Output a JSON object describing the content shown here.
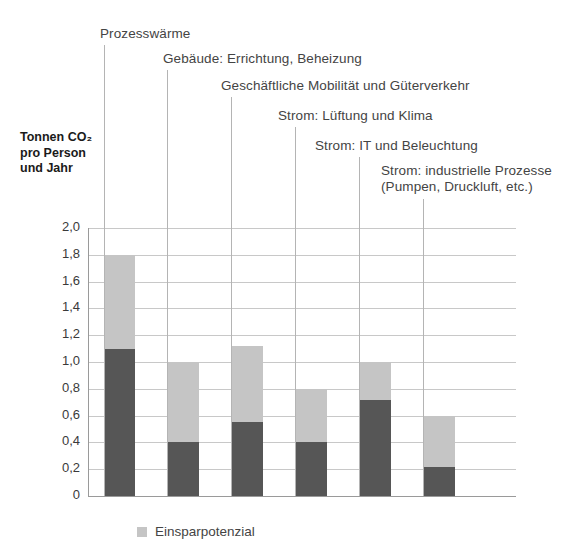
{
  "axis_title": "Tonnen CO₂\npro Person\nund Jahr",
  "legend": {
    "swatch_name": "einsparpotenzial-swatch",
    "label": "Einsparpotenzial"
  },
  "callouts": [
    {
      "text": "Prozesswärme"
    },
    {
      "text": "Gebäude: Errichtung, Beheizung"
    },
    {
      "text": "Geschäftliche Mobilität und Güterverkehr"
    },
    {
      "text": "Strom: Lüftung und Klima"
    },
    {
      "text": "Strom: IT und Beleuchtung"
    },
    {
      "text": "Strom: industrielle Prozesse\n(Pumpen, Druckluft, etc.)"
    }
  ],
  "chart_data": {
    "type": "bar",
    "title": "",
    "subtitle": "",
    "xlabel": "",
    "ylabel": "Tonnen CO₂ pro Person und Jahr",
    "ylim": [
      0,
      2.0
    ],
    "ytick_step": 0.2,
    "ytick_labels": [
      "0",
      "0,2",
      "0,4",
      "0,6",
      "0,8",
      "1,0",
      "1,2",
      "1,4",
      "1,6",
      "1,8",
      "2,0"
    ],
    "ytick_values": [
      0,
      0.2,
      0.4,
      0.6,
      0.8,
      1.0,
      1.2,
      1.4,
      1.6,
      1.8,
      2.0
    ],
    "grid": true,
    "stacked": true,
    "legend_position": "bottom",
    "categories": [
      "Prozesswärme",
      "Gebäude: Errichtung, Beheizung",
      "Geschäftliche Mobilität und Güterverkehr",
      "Strom: Lüftung und Klima",
      "Strom: IT und Beleuchtung",
      "Strom: industrielle Prozesse (Pumpen, Druckluft, etc.)"
    ],
    "series": [
      {
        "name": "Verbleibende Emissionen",
        "color": "#565656",
        "values": [
          1.1,
          0.4,
          0.55,
          0.4,
          0.72,
          0.22
        ]
      },
      {
        "name": "Einsparpotenzial",
        "color": "#c5c5c5",
        "values": [
          0.7,
          0.6,
          0.57,
          0.4,
          0.28,
          0.38
        ]
      }
    ],
    "totals": [
      1.8,
      1.0,
      1.12,
      0.8,
      1.0,
      0.6
    ]
  },
  "colors": {
    "dark": "#565656",
    "light": "#c5c5c5",
    "grid": "#c8c8c8",
    "axis": "#9a9a9a",
    "text": "#444444"
  }
}
